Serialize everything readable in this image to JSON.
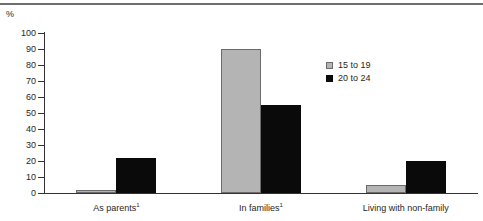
{
  "chart_data": {
    "type": "bar",
    "title": "",
    "subtitle": "",
    "xlabel": "",
    "ylabel": "%",
    "ylim": [
      0,
      100
    ],
    "ytick_step": 10,
    "yticks": [
      100,
      90,
      80,
      70,
      60,
      50,
      40,
      30,
      20,
      10,
      0
    ],
    "ytick_labels": [
      "100",
      "90",
      "80",
      "70",
      "60",
      "50",
      "40",
      "30",
      "20",
      "10",
      "0"
    ],
    "grid": false,
    "legend_position": "inside-upper-right",
    "categories": [
      "As parents",
      "In families",
      "Living with non-family"
    ],
    "category_footnotes": [
      "1",
      "1",
      ""
    ],
    "category_labels": [
      "As parents¹",
      "In families¹",
      "Living with non-family"
    ],
    "series": [
      {
        "name": "15 to 19",
        "color": "#b4b4b4",
        "edge_color": "#6b6b6b",
        "values": [
          2,
          90,
          5
        ]
      },
      {
        "name": "20 to 24",
        "color": "#0a0a0a",
        "edge_color": "#0a0a0a",
        "values": [
          22,
          55,
          20
        ]
      }
    ],
    "annotations": []
  },
  "axis": {
    "unit_label": "%"
  },
  "legend": {
    "items": [
      {
        "label": "15 to 19",
        "swatch": "gray-square-swatch"
      },
      {
        "label": "20 to 24",
        "swatch": "black-square-swatch"
      }
    ]
  }
}
